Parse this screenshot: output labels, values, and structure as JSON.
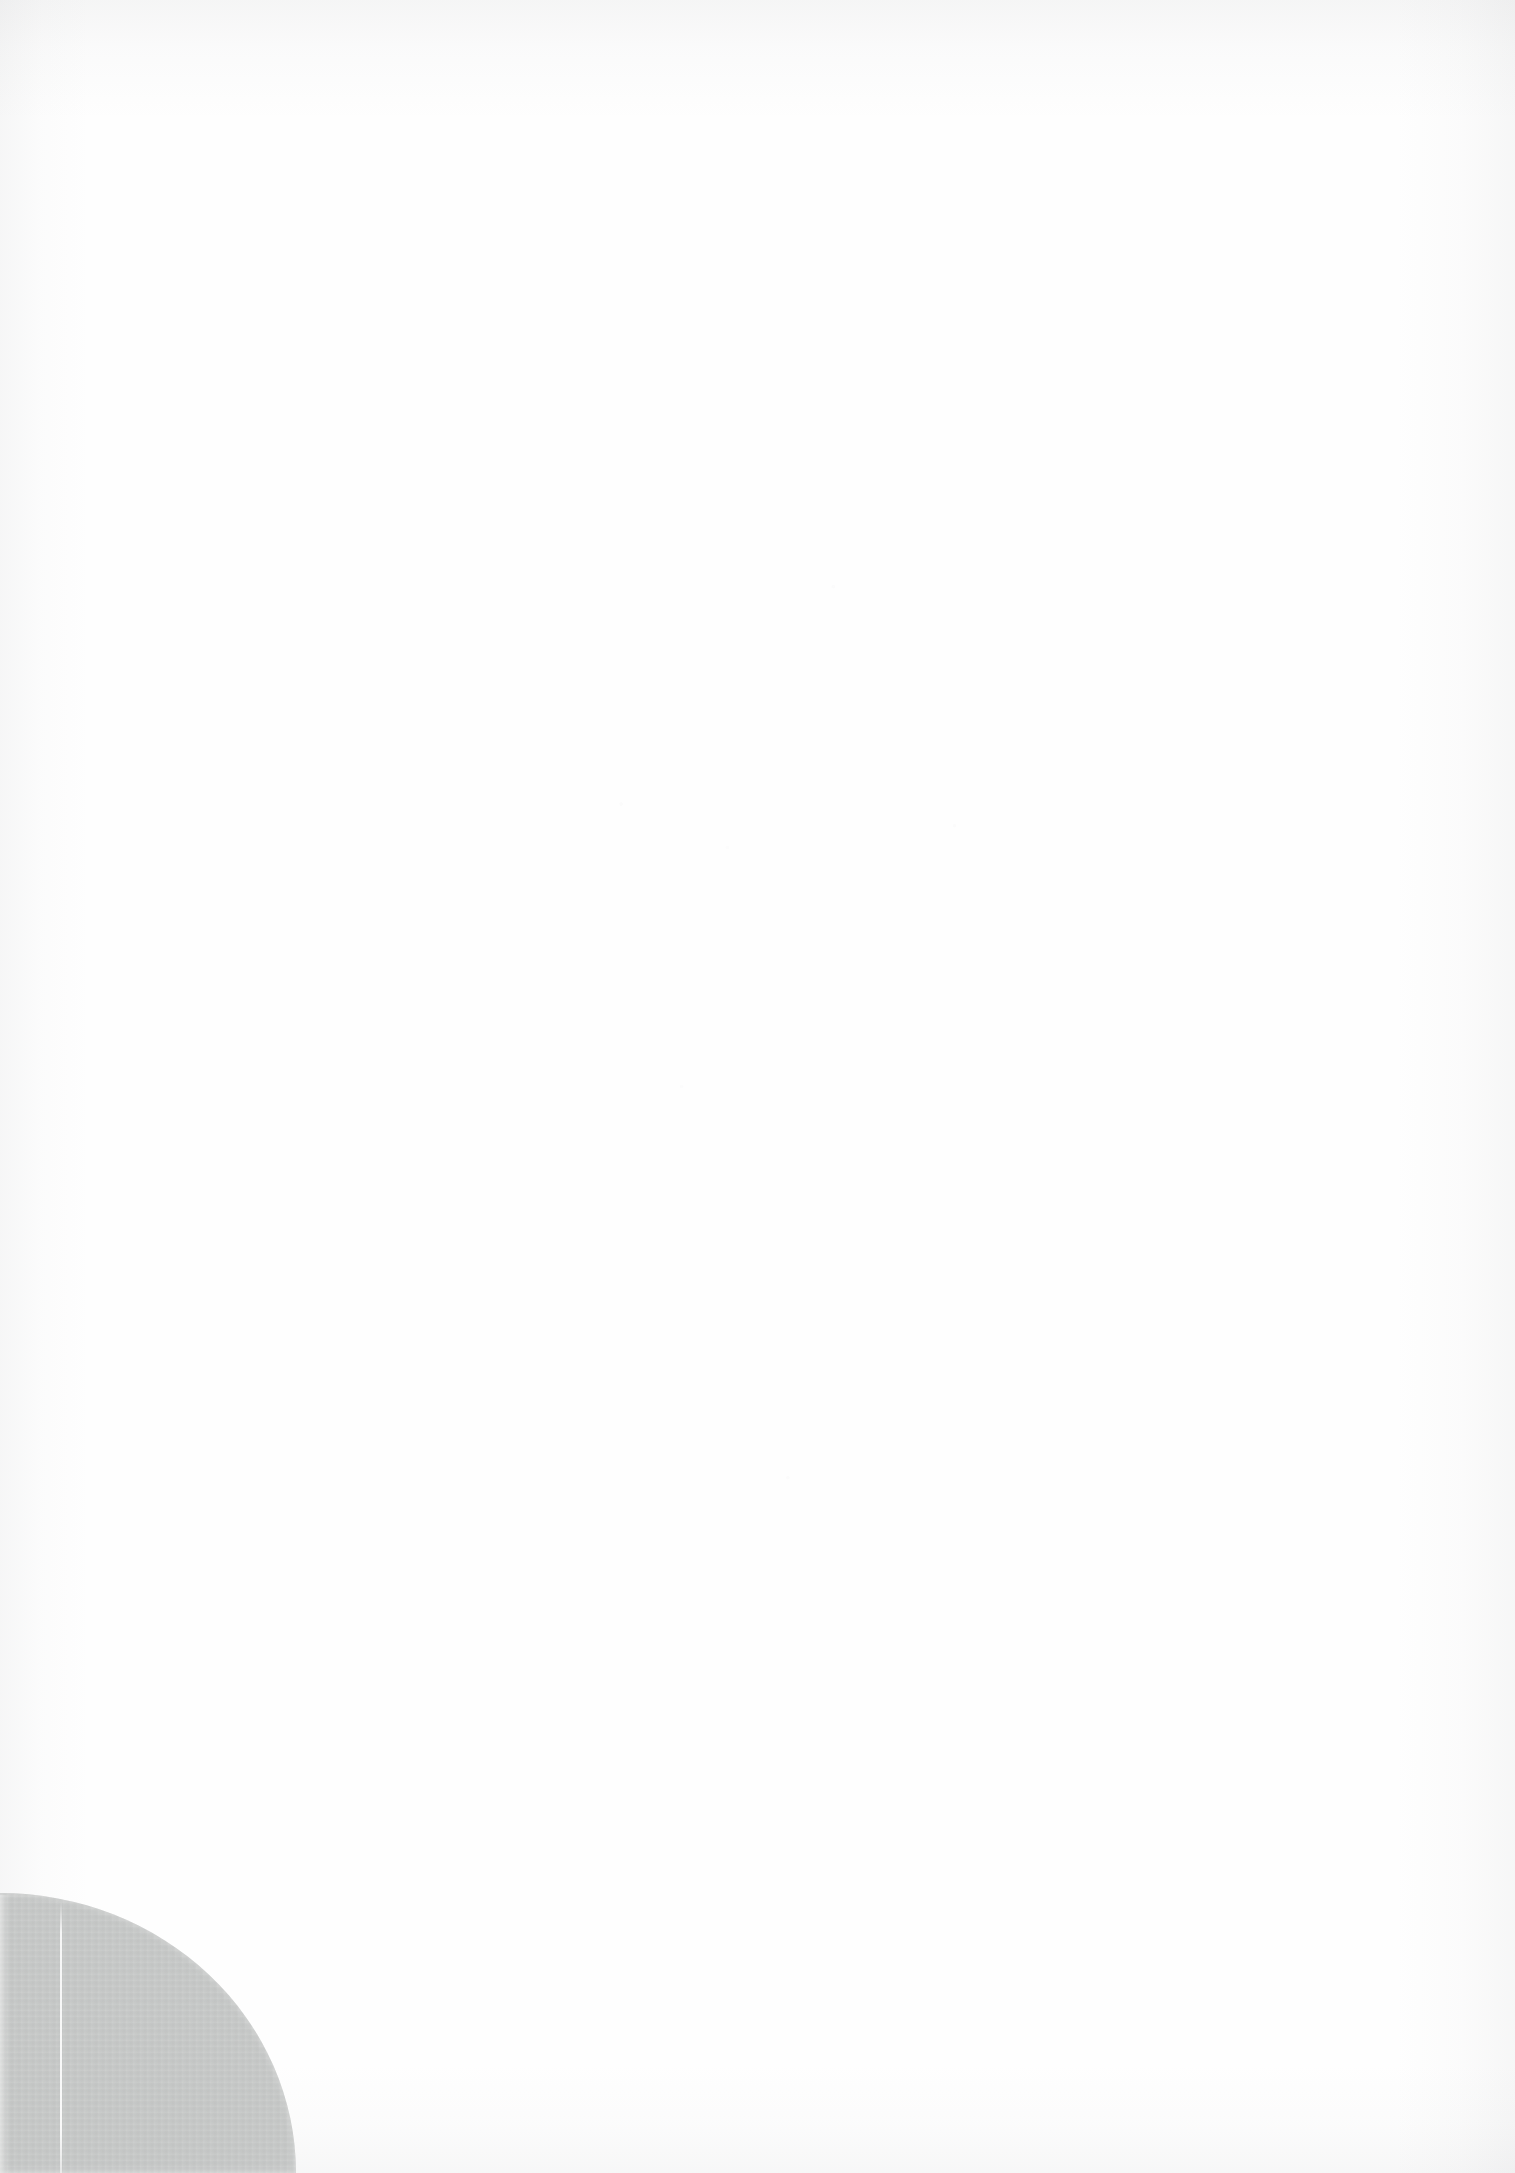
{
  "page": {
    "width_px": 1515,
    "height_px": 2173,
    "background_color": "#fefefe",
    "content_text": ""
  },
  "corner_graphic": {
    "name": "bottom-left-corner-shape",
    "shape": "quarter-ellipse",
    "color": "#c6c8c7",
    "left_px": 0,
    "top_px": 1893,
    "width_px": 296,
    "height_px": 280,
    "label": ""
  },
  "crease": {
    "name": "vertical-crease-line",
    "x_px": 60,
    "top_px": 1900,
    "height_px": 273,
    "color": "#ffffff"
  },
  "edge_band": {
    "name": "left-edge-band",
    "x_px": 0,
    "top_px": 1895,
    "width_px": 10,
    "height_px": 278
  },
  "scan_artifacts": {
    "top_shading": "rgba(150,152,155,0.085)",
    "left_shading": "rgba(150,152,155,0.075)",
    "right_shading": "rgba(150,152,155,0.075)",
    "bottom_shading": "rgba(150,152,155,0.07)",
    "noise_color": "rgba(120,122,126,0.05)"
  }
}
